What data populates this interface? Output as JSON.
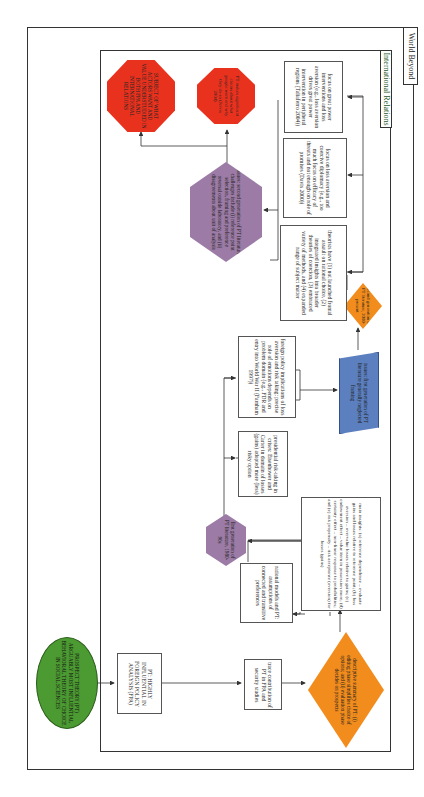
{
  "frames": {
    "outer_label": "World Beyond",
    "inner_label": "International Relations"
  },
  "colors": {
    "red": "#e8321e",
    "purple": "#9c7ba6",
    "orange": "#f28c1c",
    "blue": "#5b7fbf",
    "green": "#4c9a32",
    "line": "#333333"
  },
  "nodes": {
    "root": "PROSPECT THEORY (PT) ARGUABLY MOST INFLUENTIAL BEHAVIORAL THEORY OF CHOICE IN SOCIAL SCIENCES",
    "fpa": "PT: HIGHLY INFLUENTIAL IN FOREIGN POLICY ANALYSIS (FPA)",
    "trace": "trace contribution of PT in FPA and security studies",
    "descriptive": "descriptive summary of PT: (i) editing phase simplifies choice of options; and (ii) evaluation phase decides on prospects",
    "rational": "rational models and PT: assumptions of connected and transitive preferences",
    "insights": "main insights: (a) reference dependence – evaluate gains and losses relative to reference point; (b) loss aversion – overvalue losses relative to gains; (c) endowment effect – value item in possession more; (d) certainty effect – non-linear response to probabilities; and (e) risk propensity – risk acceptance (aversion) for losses (gains)",
    "first_gen": "first generation of PT literature, 1980-90s",
    "presidential": "presidential risk-taking in crises: Eisenhower and Carter in domain of losses (gains) adopted more (less) risky option",
    "foreign_policy": "foreign policy implications of loss aversion and risk taking: precise role of emotions depends on problem domain (e.g., FDR and entry into World War II (Farnham 1997))",
    "first_gen_issues": "issues: first generation of PT literature generally neglected framing",
    "second_gen": "second generation of PT literature, 2000-present",
    "theorists": "theorists have (1) not launched frontal assault on rational choice, (2) integrated insights into broader theories of coercion, (3) embraced variety of methods, and (4) expanded range of subject matter",
    "coercive": "focus on loss aversion and coercive diplomacy (e.g., too much focus on efficacy of threats and not enough on role of promises (Davis 2000))",
    "great_power": "focus on great power interventions and loss aversion (e.g., loss aversion drives great power intervention in peripheral regions (Taliaferro 2004))",
    "second_gen_issues": "issues: second generation of PT literature challenges include (i) reference point selection, framing and preference reversal outside laboratory, and (ii) disagreements about unit of analysis",
    "pt_claims": "PT makes significant claims about what people want and why they do so (Jervis 2004)",
    "subject": "SUBJECT OF WHAT ACTORS WANT AND VALUE UNDERSTUDIED IN BOTH FPA AND INTERNATIONAL RELATIONS"
  }
}
